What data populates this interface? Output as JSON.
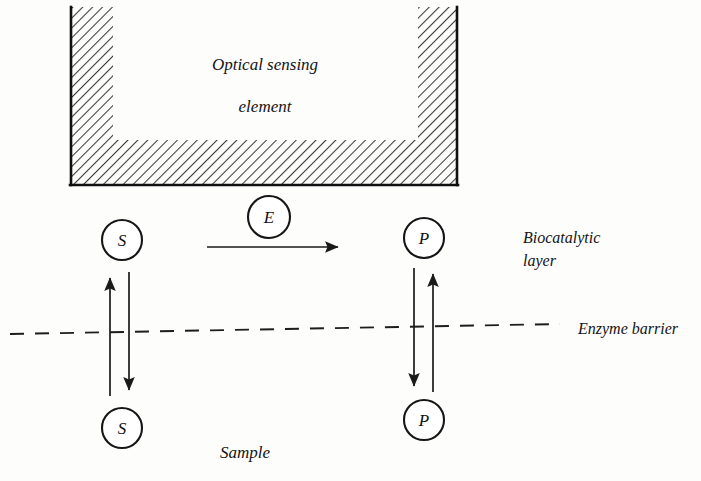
{
  "figure": {
    "background_color": "#fdfdfc",
    "ink_color": "#141414"
  },
  "labels": {
    "sensing_element_line1": "Optical sensing",
    "sensing_element_line2": "element",
    "biocatalytic_line1": "Biocatalytic",
    "biocatalytic_line2": "layer",
    "enzyme_barrier": "Enzyme barrier",
    "sample": "Sample"
  },
  "nodes": {
    "substrate_upper": {
      "letter": "S",
      "cx": 122,
      "cy": 240,
      "r": 20
    },
    "substrate_lower": {
      "letter": "S",
      "cx": 122,
      "cy": 428,
      "r": 20
    },
    "product_upper": {
      "letter": "P",
      "cx": 424,
      "cy": 238,
      "r": 20
    },
    "product_lower": {
      "letter": "P",
      "cx": 424,
      "cy": 420,
      "r": 20
    },
    "enzyme": {
      "letter": "E",
      "cx": 269,
      "cy": 217,
      "r": 21
    }
  },
  "arrows": {
    "reaction": {
      "from_x": 207,
      "from_y": 247,
      "to_x": 344,
      "to_y": 247,
      "direction": "right"
    },
    "substrate_up": {
      "x": 110,
      "from_y": 396,
      "to_y": 272,
      "direction": "up"
    },
    "substrate_down": {
      "x": 129,
      "from_y": 272,
      "to_y": 396,
      "direction": "down"
    },
    "product_down": {
      "x": 414,
      "from_y": 268,
      "to_y": 392,
      "direction": "down"
    },
    "product_up": {
      "x": 433,
      "from_y": 392,
      "to_y": 268,
      "direction": "up"
    }
  },
  "barrier": {
    "start_x": 10,
    "start_y": 334,
    "end_x": 560,
    "end_y": 324
  },
  "sensing_element": {
    "outer_left": 71,
    "outer_right": 457,
    "outer_top": 7,
    "outer_bottom": 185,
    "cavity_left": 113,
    "cavity_right": 418,
    "cavity_bottom": 140,
    "hatch_angle_deg": 45
  }
}
